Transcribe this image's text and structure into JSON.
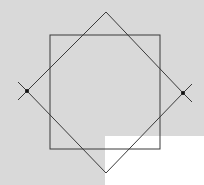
{
  "diagram": {
    "colors": {
      "background": "#d9d9d9",
      "stroke": "#3a3a3a",
      "blank_region": "#ffffff"
    },
    "square": {
      "x": 50,
      "y": 35,
      "width": 110,
      "height": 114
    },
    "diamond": {
      "top": [
        106,
        12
      ],
      "right": [
        183,
        93
      ],
      "bottom": [
        106,
        173
      ],
      "left": [
        27,
        91
      ]
    },
    "points": [
      {
        "label": "",
        "x": 27,
        "y": 91
      },
      {
        "label": "",
        "x": 183,
        "y": 93
      }
    ]
  }
}
